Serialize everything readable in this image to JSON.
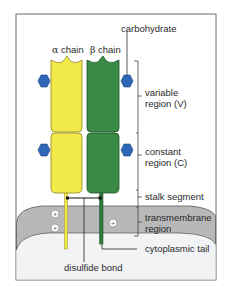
{
  "diagram": {
    "colors": {
      "alpha_chain": "#f2ea4a",
      "beta_chain": "#3a8a45",
      "carbohydrate": "#2f67b8",
      "membrane": "#b8b8b8",
      "cytoplasm": "#f2f3f4",
      "frame": "#6a6a6a"
    },
    "chains": [
      {
        "greek": "α",
        "label": "chain"
      },
      {
        "greek": "β",
        "label": "chain"
      }
    ],
    "labels": {
      "carbohydrate": "carbohydrate",
      "variable_line1": "variable",
      "variable_line2": "region (V)",
      "constant_line1": "constant",
      "constant_line2": "region (C)",
      "stalk": "stalk segment",
      "transmembrane_line1": "transmembrane",
      "transmembrane_line2": "region",
      "cytoplasmic_tail": "cytoplasmic tail",
      "disulfide_bond": "disulfide bond"
    },
    "charges": [
      "+",
      "+",
      "+"
    ]
  }
}
